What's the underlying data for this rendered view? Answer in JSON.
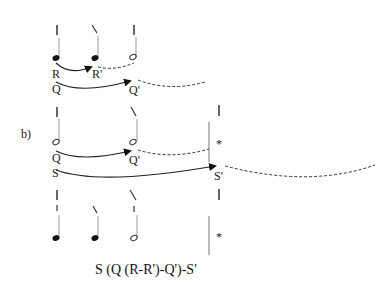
{
  "diagram": {
    "section_label": "b)",
    "formula": "S (Q (R-R')-Q')-S'",
    "rows": [
      {
        "id": "row1",
        "notes": [
          {
            "x": 57,
            "type": "quarter",
            "mark": "vertical"
          },
          {
            "x": 96,
            "type": "quarter",
            "mark": "slash"
          },
          {
            "x": 133,
            "type": "half",
            "mark": "vertical"
          }
        ],
        "arcs": [
          {
            "from": "R",
            "to": "R'",
            "labels": [
              "R",
              "R'"
            ]
          },
          {
            "from": "Q",
            "to": "Q'",
            "labels": [
              "Q",
              "Q'"
            ]
          }
        ]
      },
      {
        "id": "row2",
        "notes": [
          {
            "x": 57,
            "type": "half",
            "mark": "vertical"
          },
          {
            "x": 133,
            "type": "half",
            "mark": "slash"
          }
        ],
        "barline": true,
        "barline_mark": "vertical",
        "star": "*",
        "arcs": [
          {
            "from": "Q",
            "to": "Q'",
            "labels": [
              "Q",
              "Q'"
            ]
          },
          {
            "from": "S",
            "to": "S'",
            "labels": [
              "S",
              "S'"
            ]
          }
        ]
      },
      {
        "id": "row3",
        "notes": [
          {
            "x": 57,
            "type": "quarter",
            "mark": "double-vertical"
          },
          {
            "x": 96,
            "type": "quarter",
            "mark": "slash"
          },
          {
            "x": 133,
            "type": "half",
            "mark": "slash-vertical"
          }
        ],
        "barline": true,
        "barline_mark": "vertical",
        "star": "*"
      }
    ],
    "labels": {
      "R": "R",
      "R_prime": "R'",
      "Q1": "Q",
      "Q1_prime": "Q'",
      "Q2": "Q",
      "Q2_prime": "Q'",
      "S": "S",
      "S_prime": "S'",
      "star1": "*",
      "star2": "*"
    }
  }
}
